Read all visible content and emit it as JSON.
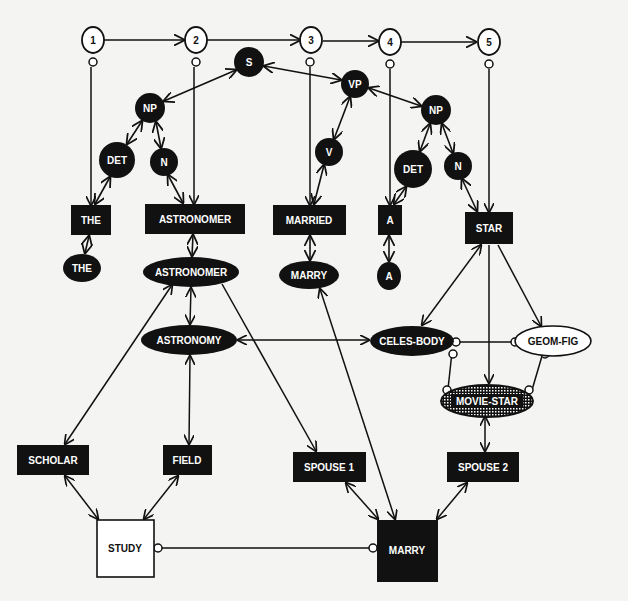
{
  "diagram": {
    "kind": "semantic parse network",
    "colors": {
      "background": "#f4f4f2",
      "ink": "#111111",
      "inverse_text": "#ffffff"
    },
    "word_positions": [
      {
        "id": "p1",
        "label": "1",
        "x": 93,
        "y": 40
      },
      {
        "id": "p2",
        "label": "2",
        "x": 196,
        "y": 40
      },
      {
        "id": "p3",
        "label": "3",
        "x": 312,
        "y": 40
      },
      {
        "id": "p4",
        "label": "4",
        "x": 390,
        "y": 42
      },
      {
        "id": "p5",
        "label": "5",
        "x": 488,
        "y": 42
      }
    ],
    "syntax_nodes": [
      {
        "id": "S",
        "label": "S",
        "x": 249,
        "y": 62,
        "r": 15
      },
      {
        "id": "NP1",
        "label": "NP",
        "x": 150,
        "y": 108,
        "r": 15
      },
      {
        "id": "DET1",
        "label": "DET",
        "x": 117,
        "y": 160,
        "r": 18
      },
      {
        "id": "N1",
        "label": "N",
        "x": 164,
        "y": 162,
        "r": 14
      },
      {
        "id": "VP",
        "label": "VP",
        "x": 355,
        "y": 84,
        "r": 14
      },
      {
        "id": "V",
        "label": "V",
        "x": 329,
        "y": 152,
        "r": 14
      },
      {
        "id": "NP2",
        "label": "NP",
        "x": 436,
        "y": 110,
        "r": 15
      },
      {
        "id": "DET2",
        "label": "DET",
        "x": 413,
        "y": 169,
        "r": 19
      },
      {
        "id": "N2",
        "label": "N",
        "x": 458,
        "y": 166,
        "r": 14
      }
    ],
    "word_nodes": [
      {
        "id": "w-the",
        "label": "THE",
        "x": 71,
        "y": 205,
        "w": 40,
        "h": 30
      },
      {
        "id": "w-astronomer",
        "label": "ASTRONOMER",
        "x": 145,
        "y": 204,
        "w": 100,
        "h": 30
      },
      {
        "id": "w-married",
        "label": "MARRIED",
        "x": 273,
        "y": 205,
        "w": 73,
        "h": 30
      },
      {
        "id": "w-a",
        "label": "A",
        "x": 378,
        "y": 205,
        "w": 24,
        "h": 30
      },
      {
        "id": "w-star",
        "label": "STAR",
        "x": 465,
        "y": 212,
        "w": 48,
        "h": 32
      }
    ],
    "lexeme_nodes": [
      {
        "id": "l-the",
        "label": "THE",
        "x": 82,
        "y": 268,
        "rx": 19,
        "ry": 14
      },
      {
        "id": "l-astronomer",
        "label": "ASTRONOMER",
        "x": 191,
        "y": 272,
        "rx": 48,
        "ry": 15
      },
      {
        "id": "l-marry",
        "label": "MARRY",
        "x": 309,
        "y": 275,
        "rx": 30,
        "ry": 14
      },
      {
        "id": "l-a",
        "label": "A",
        "x": 389,
        "y": 276,
        "rx": 12,
        "ry": 14
      }
    ],
    "concept_nodes": [
      {
        "id": "c-astronomy",
        "label": "ASTRONOMY",
        "x": 189,
        "y": 340,
        "rx": 48,
        "ry": 15,
        "style": "filled"
      },
      {
        "id": "c-celes-body",
        "label": "CELES-BODY",
        "x": 412,
        "y": 341,
        "rx": 42,
        "ry": 15,
        "style": "filled"
      },
      {
        "id": "c-geom-fig",
        "label": "GEOM-FIG",
        "x": 551,
        "y": 341,
        "rx": 38,
        "ry": 15,
        "style": "outline"
      },
      {
        "id": "c-movie-star",
        "label": "MOVIE-STAR",
        "x": 485,
        "y": 400,
        "rx": 46,
        "ry": 16,
        "style": "hatched"
      }
    ],
    "role_nodes": [
      {
        "id": "r-scholar",
        "label": "SCHOLAR",
        "x": 17,
        "y": 445,
        "w": 72,
        "h": 30
      },
      {
        "id": "r-field",
        "label": "FIELD",
        "x": 163,
        "y": 445,
        "w": 49,
        "h": 30
      },
      {
        "id": "r-spouse1",
        "label": "SPOUSE 1",
        "x": 293,
        "y": 452,
        "w": 73,
        "h": 30
      },
      {
        "id": "r-spouse2",
        "label": "SPOUSE 2",
        "x": 447,
        "y": 452,
        "w": 72,
        "h": 30
      }
    ],
    "event_nodes": [
      {
        "id": "e-study",
        "label": "STUDY",
        "x": 97,
        "y": 520,
        "w": 57,
        "h": 57,
        "style": "outline"
      },
      {
        "id": "e-marry",
        "label": "MARRY",
        "x": 377,
        "y": 520,
        "w": 61,
        "h": 62,
        "style": "filled"
      }
    ]
  }
}
